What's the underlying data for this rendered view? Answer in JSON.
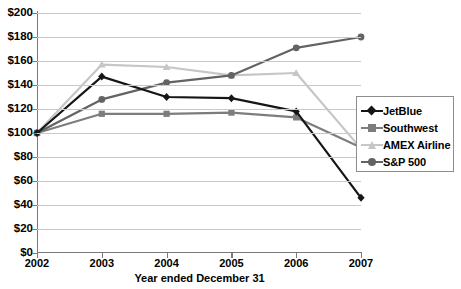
{
  "chart_data": {
    "type": "line",
    "title": "",
    "xlabel": "Year ended December 31",
    "ylabel": "",
    "x": [
      "2002",
      "2003",
      "2004",
      "2005",
      "2006",
      "2007"
    ],
    "categories": [
      "2002",
      "2003",
      "2004",
      "2005",
      "2006",
      "2007"
    ],
    "ylim": [
      0,
      200
    ],
    "yticks": [
      "$0",
      "$20",
      "$40",
      "$60",
      "$80",
      "$100",
      "$120",
      "$140",
      "$160",
      "$180",
      "$200"
    ],
    "ytick_values": [
      0,
      20,
      40,
      60,
      80,
      100,
      120,
      140,
      160,
      180,
      200
    ],
    "grid": true,
    "legend_position": "right",
    "series": [
      {
        "name": "JetBlue",
        "values": [
          100,
          147,
          130,
          129,
          118,
          46
        ],
        "color": "#161616",
        "marker": "diamond"
      },
      {
        "name": "Southwest",
        "values": [
          100,
          116,
          116,
          117,
          113,
          88
        ],
        "color": "#7d7d7d",
        "marker": "square"
      },
      {
        "name": "AMEX Airline",
        "values": [
          100,
          157,
          155,
          148,
          150,
          87
        ],
        "color": "#c6c6c6",
        "marker": "triangle"
      },
      {
        "name": "S&P 500",
        "values": [
          100,
          128,
          142,
          148,
          171,
          180
        ],
        "color": "#636363",
        "marker": "circle"
      }
    ]
  },
  "legend": {
    "items": [
      {
        "label": "JetBlue"
      },
      {
        "label": "Southwest"
      },
      {
        "label": "AMEX Airline"
      },
      {
        "label": "S&P 500"
      }
    ]
  }
}
